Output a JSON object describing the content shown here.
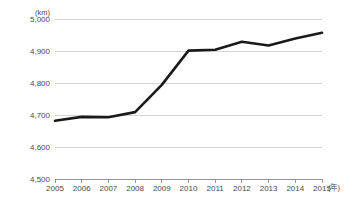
{
  "chart_data": {
    "type": "line",
    "title": "",
    "xlabel": "年",
    "ylabel": "km",
    "y_unit_label": "(km)",
    "x_unit_label": "(年)",
    "categories": [
      "2005",
      "2006",
      "2007",
      "2008",
      "2009",
      "2010",
      "2011",
      "2012",
      "2013",
      "2014",
      "2015"
    ],
    "series": [
      {
        "name": "",
        "values": [
          4683,
          4695,
          4694,
          4710,
          4795,
          4902,
          4905,
          4930,
          4918,
          4940,
          4958
        ]
      }
    ],
    "ylim": [
      4500,
      5000
    ],
    "yticks": [
      4500,
      4600,
      4700,
      4800,
      4900,
      5000
    ],
    "ytick_labels": [
      "4,500",
      "4,600",
      "4,700",
      "4,800",
      "4,900",
      "5,000"
    ],
    "xtick_labels": [
      "2005",
      "2006",
      "2007",
      "2008",
      "2009",
      "2010",
      "2011",
      "2012",
      "2013",
      "2014",
      "2015"
    ],
    "grid": true,
    "grid_axis": "y",
    "legend": false,
    "legend_position": "none",
    "line_color": "#1a1a1a",
    "grid_color": "#c8c8c8",
    "axis_color": "#8a8a8a",
    "label_color": "#4a4a4a",
    "background_color": "#ffffff"
  },
  "layout": {
    "plot_left": 55,
    "plot_right": 322,
    "plot_top": 19.3,
    "plot_bottom": 179.3
  }
}
